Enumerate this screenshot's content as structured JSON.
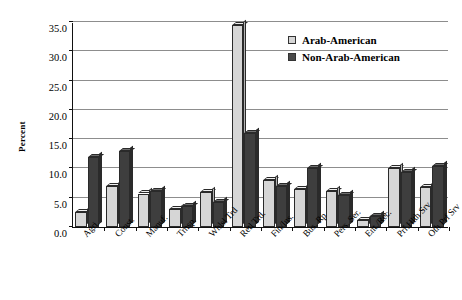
{
  "chart_data": {
    "type": "bar",
    "title": "",
    "xlabel": "",
    "ylabel": "Percent",
    "ylim": [
      0.0,
      35.0
    ],
    "yticks": [
      "0.0",
      "5.0",
      "10.0",
      "15.0",
      "20.0",
      "25.0",
      "30.0",
      "35.0"
    ],
    "ytick_values": [
      0.0,
      5.0,
      10.0,
      15.0,
      20.0,
      25.0,
      30.0,
      35.0
    ],
    "grid": true,
    "legend_position": "top-right",
    "categories": [
      "Agri.",
      "Const.",
      "Manuf.",
      "Trnsp.",
      "Whlsl Trd",
      "Retl Trd.",
      "Fin/Ins.",
      "Bus. Rp",
      "Pers. Ser.",
      "Ent./Rec.",
      "Prf.Hlth Srv",
      "Oth Prf Srv"
    ],
    "series": [
      {
        "name": "Arab-American",
        "color": "#d6d6d6",
        "values": [
          2.5,
          7.0,
          5.7,
          3.1,
          6.0,
          34.5,
          8.0,
          6.5,
          6.1,
          1.2,
          10.0,
          6.8
        ]
      },
      {
        "name": "Non-Arab-American",
        "color": "#3e3e3e",
        "values": [
          12.0,
          13.0,
          6.2,
          3.6,
          4.2,
          16.0,
          7.0,
          10.0,
          5.5,
          1.9,
          9.4,
          10.4
        ]
      }
    ]
  },
  "legend": {
    "items": [
      {
        "label": "Arab-American",
        "swatch": "light"
      },
      {
        "label": "Non-Arab-American",
        "swatch": "dark"
      }
    ]
  }
}
